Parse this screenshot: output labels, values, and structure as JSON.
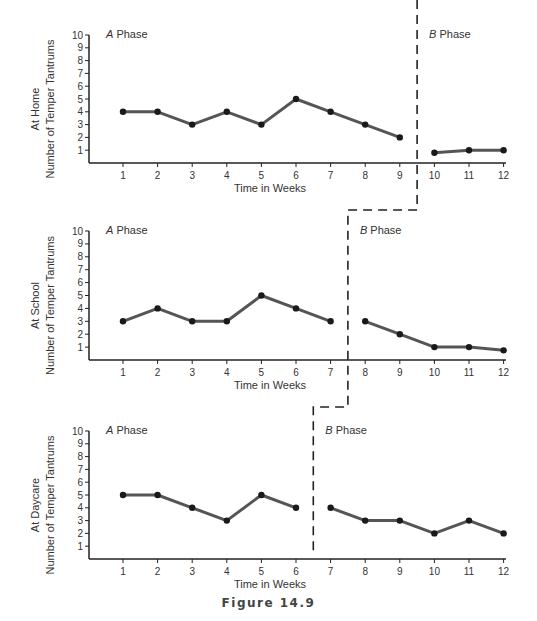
{
  "figure": {
    "caption": "Figure 14.9"
  },
  "chart_data": [
    {
      "type": "line",
      "panel": "top",
      "setting_label": "At Home",
      "ylabel": "Number of Temper Tantrums",
      "xlabel": "Time in Weeks",
      "ylim": [
        0,
        10
      ],
      "yticks": [
        1,
        2,
        3,
        4,
        5,
        6,
        7,
        8,
        9,
        10
      ],
      "xticks": [
        1,
        2,
        3,
        4,
        5,
        6,
        7,
        8,
        9,
        10,
        11,
        12
      ],
      "phase_change_after_week": 9,
      "phase_labels": {
        "a": "A Phase",
        "b": "B Phase"
      },
      "series": [
        {
          "name": "A Phase",
          "x": [
            1,
            2,
            3,
            4,
            5,
            6,
            7,
            8,
            9
          ],
          "values": [
            4,
            4,
            3,
            4,
            3,
            5,
            4,
            3,
            2
          ]
        },
        {
          "name": "B Phase",
          "x": [
            10,
            11,
            12
          ],
          "values": [
            0.8,
            1,
            1
          ]
        }
      ]
    },
    {
      "type": "line",
      "panel": "middle",
      "setting_label": "At School",
      "ylabel": "Number of Temper Tantrums",
      "xlabel": "Time in Weeks",
      "ylim": [
        0,
        10
      ],
      "yticks": [
        1,
        2,
        3,
        4,
        5,
        6,
        7,
        8,
        9,
        10
      ],
      "xticks": [
        1,
        2,
        3,
        4,
        5,
        6,
        7,
        8,
        9,
        10,
        11,
        12
      ],
      "phase_change_after_week": 7,
      "phase_labels": {
        "a": "A Phase",
        "b": "B Phase"
      },
      "series": [
        {
          "name": "A Phase",
          "x": [
            1,
            2,
            3,
            4,
            5,
            6,
            7
          ],
          "values": [
            3,
            4,
            3,
            3,
            5,
            4,
            3
          ]
        },
        {
          "name": "B Phase",
          "x": [
            8,
            9,
            10,
            11,
            12
          ],
          "values": [
            3,
            2,
            1,
            1,
            0.75
          ]
        }
      ]
    },
    {
      "type": "line",
      "panel": "bottom",
      "setting_label": "At Daycare",
      "ylabel": "Number of Temper Tantrums",
      "xlabel": "Time in Weeks",
      "ylim": [
        0,
        10
      ],
      "yticks": [
        1,
        2,
        3,
        4,
        5,
        6,
        7,
        8,
        9,
        10
      ],
      "xticks": [
        1,
        2,
        3,
        4,
        5,
        6,
        7,
        8,
        9,
        10,
        11,
        12
      ],
      "phase_change_after_week": 6,
      "phase_labels": {
        "a": "A Phase",
        "b": "B Phase"
      },
      "series": [
        {
          "name": "A Phase",
          "x": [
            1,
            2,
            3,
            4,
            5,
            6
          ],
          "values": [
            5,
            5,
            4,
            3,
            5,
            4
          ]
        },
        {
          "name": "B Phase",
          "x": [
            7,
            8,
            9,
            10,
            11,
            12
          ],
          "values": [
            4,
            3,
            3,
            2,
            3,
            2
          ]
        }
      ]
    }
  ],
  "style": {
    "line_color": "#555555",
    "marker_color": "#1a1a1a",
    "axis_color": "#222222",
    "dash_color": "#222222"
  }
}
